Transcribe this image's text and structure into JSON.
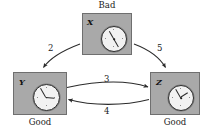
{
  "diagram": {
    "type": "state-transition-graph",
    "background": "#ffffff",
    "node_fill": "#a9a9a9",
    "node_stroke": "#6f6f6f",
    "edge_color": "#2b2b2b",
    "nodes": [
      {
        "id": "X",
        "caption": "Bad",
        "caption_position": "above",
        "icon": "clock-icon",
        "clock_time": "11:55"
      },
      {
        "id": "Y",
        "caption": "Good",
        "caption_position": "below",
        "icon": "clock-icon",
        "clock_time": "2:55"
      },
      {
        "id": "Z",
        "caption": "Good",
        "caption_position": "below",
        "icon": "clock-icon",
        "clock_time": "1:55"
      }
    ],
    "edges": [
      {
        "from": "X",
        "to": "Y",
        "label": "2",
        "shape": "curved"
      },
      {
        "from": "X",
        "to": "Z",
        "label": "5",
        "shape": "curved"
      },
      {
        "from": "Y",
        "to": "Z",
        "label": "3",
        "shape": "curved"
      },
      {
        "from": "Z",
        "to": "Y",
        "label": "4",
        "shape": "curved"
      }
    ]
  }
}
